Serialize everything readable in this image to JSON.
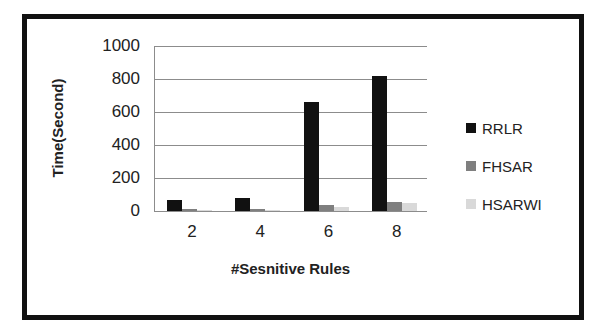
{
  "chart_data": {
    "type": "bar",
    "title": "",
    "xlabel": "#Sesnitive Rules",
    "ylabel": "Time(Second)",
    "categories": [
      "2",
      "4",
      "6",
      "8"
    ],
    "series": [
      {
        "name": "RRLR",
        "color": "#111111",
        "values": [
          68,
          80,
          660,
          820
        ]
      },
      {
        "name": "FHSAR",
        "color": "#7f7f7f",
        "values": [
          10,
          12,
          35,
          55
        ]
      },
      {
        "name": "HSARWI",
        "color": "#d9d9d9",
        "values": [
          5,
          6,
          25,
          50
        ]
      }
    ],
    "ylim": [
      0,
      1000
    ],
    "yticks": [
      "0",
      "200",
      "400",
      "600",
      "800",
      "1000"
    ],
    "grid": true,
    "legend_position": "right"
  }
}
